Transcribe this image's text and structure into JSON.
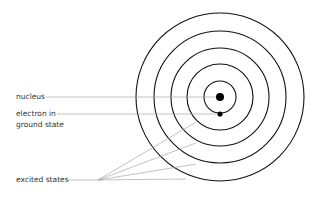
{
  "diagram": {
    "labels": {
      "nucleus": "nucleus",
      "electron_line1": "electron in",
      "electron_line2": "ground state",
      "excited": "excited states"
    },
    "center": [
      220,
      97
    ],
    "orbit_radii": [
      16,
      33,
      49,
      66,
      84
    ],
    "colors": {
      "orbit": "#111111",
      "leader": "#999999",
      "text": "#333333"
    }
  }
}
